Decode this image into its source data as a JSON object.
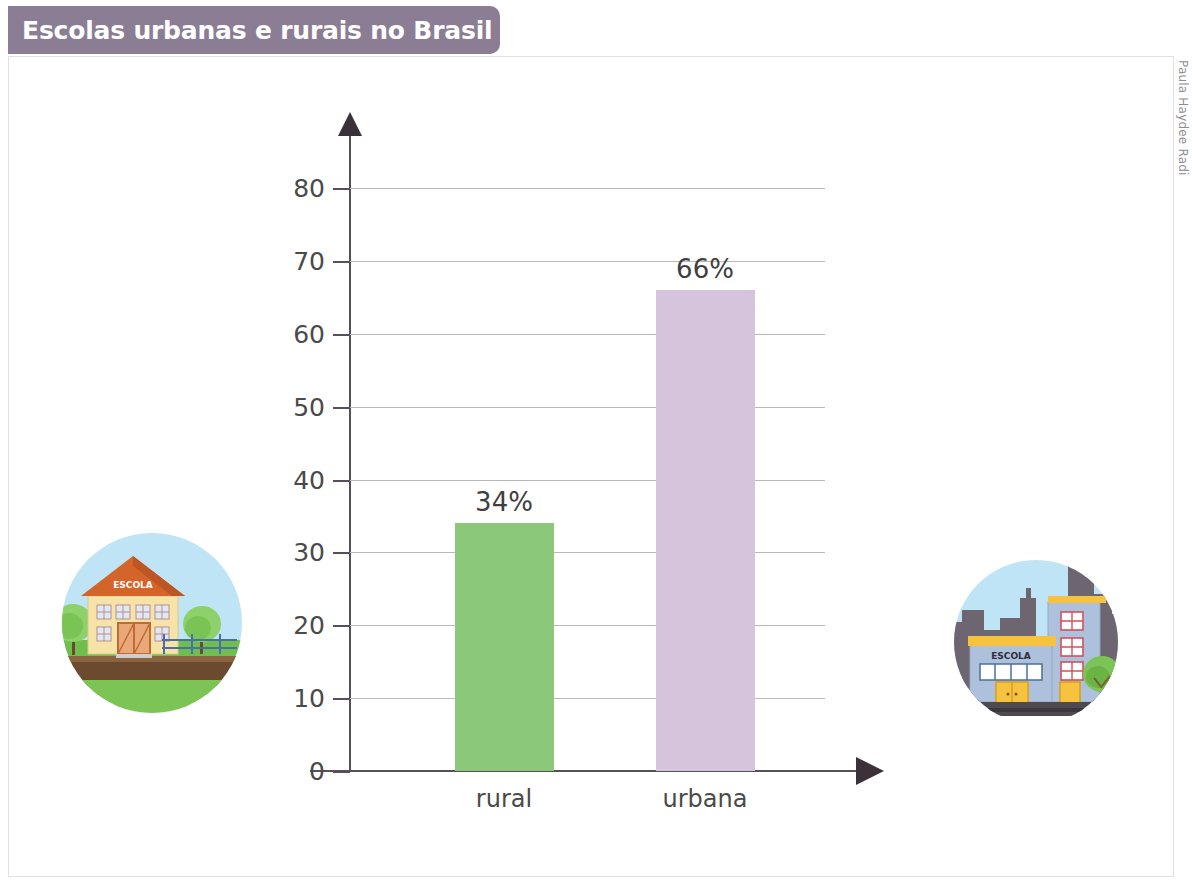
{
  "header": {
    "title": "Escolas urbanas e rurais no Brasil",
    "banner_color": "#8b7d94"
  },
  "credit": {
    "text": "Paula Haydee Radi"
  },
  "chart_data": {
    "type": "bar",
    "title": "Escolas urbanas e rurais no Brasil",
    "categories": [
      "rural",
      "urbana"
    ],
    "values": [
      34,
      66
    ],
    "data_labels": [
      "34%",
      "66%"
    ],
    "series": [
      {
        "name": "percentual de escolas",
        "values": [
          34,
          66
        ]
      }
    ],
    "colors": [
      "#8cc87a",
      "#d5c4db"
    ],
    "xlabel": "",
    "ylabel": "",
    "ylim": [
      0,
      80
    ],
    "yticks": [
      0,
      10,
      20,
      30,
      40,
      50,
      60,
      70,
      80
    ],
    "ytick_labels": [
      "0",
      "10",
      "20",
      "30",
      "40",
      "50",
      "60",
      "70",
      "80"
    ],
    "grid": true,
    "legend": false,
    "axis_arrows": true
  },
  "illustrations": {
    "rural": {
      "name": "rural-school-illustration",
      "sign_text": "ESCOLA",
      "sky_color": "#bfe4f5",
      "grass_color": "#6fbe4e",
      "soil_color": "#6b4a2f",
      "building_color": "#f7e3a8",
      "roof_color": "#d4642a"
    },
    "urban": {
      "name": "urban-school-illustration",
      "sign_text": "ESCOLA",
      "sky_color": "#bfe4f5",
      "skyline_color": "#6d6570",
      "building_color": "#aec1dc",
      "trim_color": "#f5c33f",
      "road_color": "#4f4a50"
    }
  }
}
